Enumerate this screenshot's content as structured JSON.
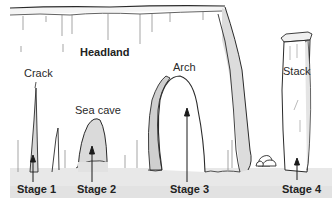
{
  "diagram": {
    "labels": {
      "headland": "Headland",
      "crack": "Crack",
      "sea_cave": "Sea cave",
      "arch": "Arch",
      "stack": "Stack"
    },
    "stages": [
      {
        "label": "Stage 1",
        "feature": "Crack"
      },
      {
        "label": "Stage 2",
        "feature": "Sea cave"
      },
      {
        "label": "Stage 3",
        "feature": "Arch"
      },
      {
        "label": "Stage 4",
        "feature": "Stack"
      }
    ],
    "colors": {
      "line": "#2a2a2a",
      "rock_face": "#ffffff",
      "rock_shade": "#d9d9d9",
      "ground": "#e6e6e6",
      "text": "#222222"
    }
  }
}
